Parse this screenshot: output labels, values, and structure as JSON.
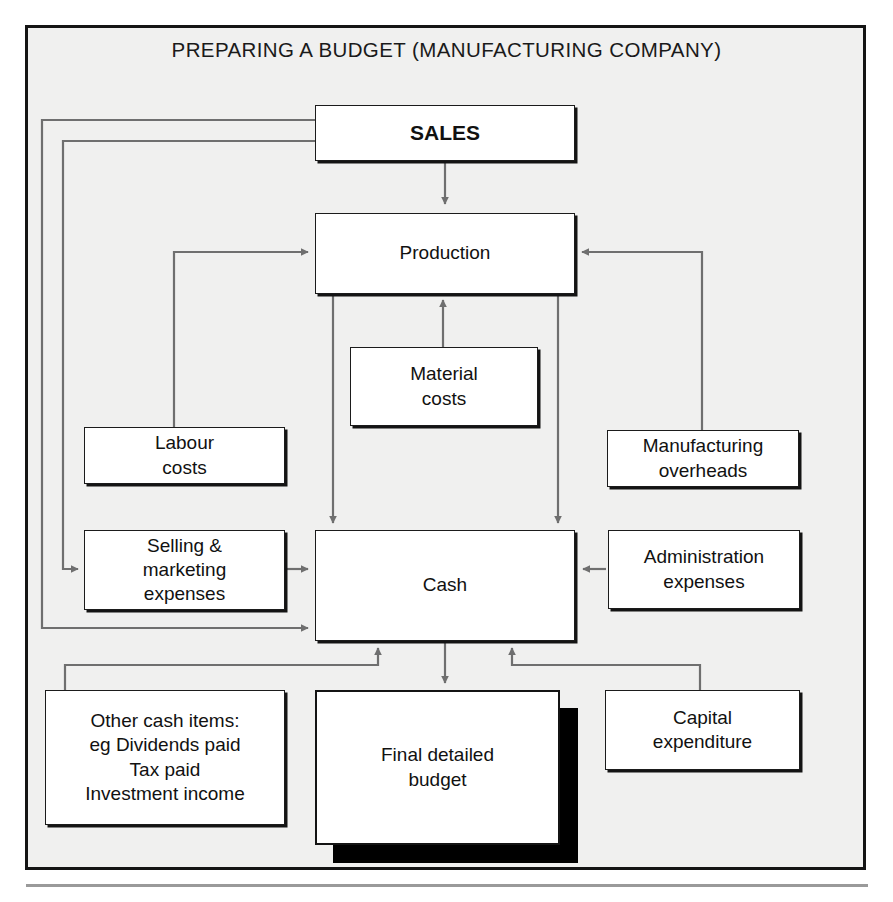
{
  "figure": {
    "title": "PREPARING A BUDGET (MANUFACTURING COMPANY)",
    "frame_border_color": "#141414",
    "background_color": "#f0f0ef",
    "node_fill": "#ffffff",
    "wire_color": "#6f6f6f"
  },
  "nodes": {
    "sales": {
      "label": "SALES"
    },
    "production": {
      "label": "Production"
    },
    "material_costs": {
      "line1": "Material",
      "line2": "costs"
    },
    "labour_costs": {
      "line1": "Labour",
      "line2": "costs"
    },
    "manufacturing_overheads": {
      "line1": "Manufacturing",
      "line2": "overheads"
    },
    "selling_marketing": {
      "line1": "Selling &",
      "line2": "marketing",
      "line3": "expenses"
    },
    "cash": {
      "label": "Cash"
    },
    "administration_expenses": {
      "line1": "Administration",
      "line2": "expenses"
    },
    "other_cash_items": {
      "line1": "Other cash items:",
      "line2": "eg Dividends paid",
      "line3": "Tax paid",
      "line4": "Investment income"
    },
    "final_budget": {
      "line1": "Final detailed",
      "line2": "budget"
    },
    "capital_expenditure": {
      "line1": "Capital",
      "line2": "expenditure"
    }
  },
  "connections": [
    {
      "from": "sales",
      "to": "production",
      "direction": "down"
    },
    {
      "from": "sales",
      "to": "selling_marketing",
      "direction": "left-loop-inner"
    },
    {
      "from": "sales",
      "to": "cash",
      "direction": "left-loop-outer"
    },
    {
      "from": "labour_costs",
      "to": "production",
      "direction": "up-right"
    },
    {
      "from": "material_costs",
      "to": "production",
      "direction": "up"
    },
    {
      "from": "manufacturing_overheads",
      "to": "production",
      "direction": "up-left"
    },
    {
      "from": "production",
      "to": "cash",
      "direction": "down-left"
    },
    {
      "from": "production",
      "to": "cash",
      "direction": "down-right"
    },
    {
      "from": "selling_marketing",
      "to": "cash",
      "direction": "right"
    },
    {
      "from": "administration_expenses",
      "to": "cash",
      "direction": "left"
    },
    {
      "from": "other_cash_items",
      "to": "cash",
      "direction": "up"
    },
    {
      "from": "capital_expenditure",
      "to": "cash",
      "direction": "up"
    },
    {
      "from": "cash",
      "to": "final_budget",
      "direction": "down"
    }
  ]
}
